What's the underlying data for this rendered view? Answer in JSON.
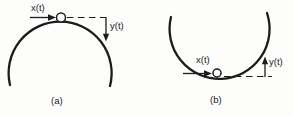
{
  "figure": {
    "colors": {
      "ink": "#1c1c1c",
      "background": "#fdfdfb"
    },
    "panels": [
      {
        "caption": "(a)",
        "curve": "dome",
        "labels": {
          "x": "x(t)",
          "y": "y(t)"
        },
        "x_arrow_direction": "right",
        "y_arrow_direction": "down"
      },
      {
        "caption": "(b)",
        "curve": "bowl",
        "labels": {
          "x": "x(t)",
          "y": "y(t)"
        },
        "x_arrow_direction": "right",
        "y_arrow_direction": "up"
      }
    ]
  }
}
